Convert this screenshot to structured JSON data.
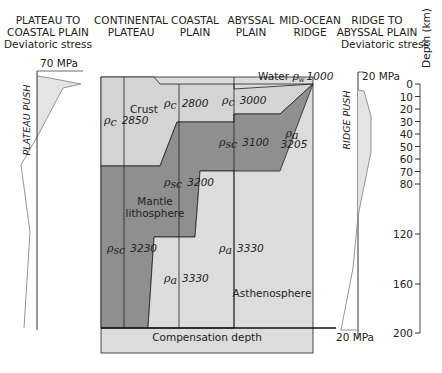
{
  "headers": {
    "plateau_to_coastal": [
      "PLATEAU TO",
      "COASTAL PLAIN",
      "Deviatoric stress"
    ],
    "continental_plateau": [
      "CONTINENTAL",
      "PLATEAU"
    ],
    "coastal_plain": [
      "COASTAL",
      "PLAIN"
    ],
    "abyssal_plain": [
      "ABYSSAL",
      "PLAIN"
    ],
    "mid_ocean_ridge": [
      "MID-OCEAN",
      "RIDGE"
    ],
    "ridge_to_abyssal": [
      "RIDGE TO",
      "ABYSSAL PLAIN",
      "Deviatoric stress"
    ]
  },
  "left_stress": {
    "scale_label": "70 MPa",
    "push_label": "PLATEAU PUSH"
  },
  "right_stress": {
    "top_scale_label": "20 MPa",
    "bottom_scale_label": "20 MPa",
    "push_label": "RIDGE PUSH"
  },
  "depth_axis": {
    "title": "Depth (km)",
    "ticks": [
      "0",
      "10",
      "20",
      "30",
      "40",
      "50",
      "60",
      "70",
      "80",
      "120",
      "160",
      "200"
    ]
  },
  "water": {
    "label": "Water",
    "rho_sub": "w",
    "density": "1000"
  },
  "crust": {
    "label": "Crust",
    "plateau": {
      "rho_sub": "c",
      "density": "2850"
    },
    "coastal": {
      "rho_sub": "c",
      "density": "2800"
    },
    "abyssal": {
      "rho_sub": "c",
      "density": "3000"
    }
  },
  "mantle_lithosphere": {
    "label_line1": "Mantle",
    "label_line2": "lithosphere",
    "plateau": {
      "rho_sub": "sc",
      "density": "3230"
    },
    "coastal": {
      "rho_sub": "sc",
      "density": "3200"
    },
    "abyssal": {
      "rho_sub": "sc",
      "density": "3100"
    }
  },
  "asthenosphere": {
    "label": "Asthenosphere",
    "ridge": {
      "rho_sub": "a",
      "density": "3205"
    },
    "coastal": {
      "rho_sub": "a",
      "density": "3330"
    },
    "abyssal": {
      "rho_sub": "a",
      "density": "3330"
    }
  },
  "compensation": {
    "label": "Compensation depth"
  },
  "colors": {
    "light_fill": "#dcdcdc",
    "crust_fill": "#d4d4d4",
    "mantle_fill": "#8f8f8f",
    "stress_fill": "#e4e4e4",
    "line": "#222222"
  }
}
